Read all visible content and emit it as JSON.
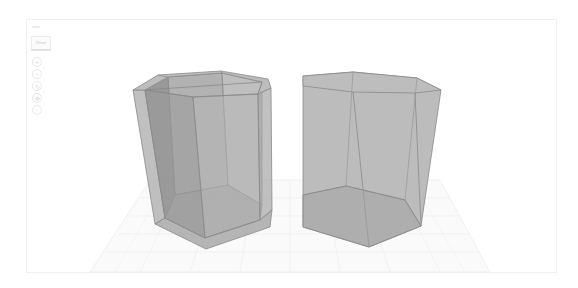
{
  "viewer": {
    "title": "3D View",
    "background": "#ffffff",
    "frame_border": "#f0f0f0"
  },
  "toolbar": {
    "header_label": "view",
    "reset_button_label": "Reset",
    "icons": [
      {
        "name": "zoom-in-icon",
        "glyph": "+"
      },
      {
        "name": "zoom-out-icon",
        "glyph": "−"
      },
      {
        "name": "rotate-icon",
        "glyph": "↻"
      },
      {
        "name": "pan-icon",
        "glyph": "✥"
      },
      {
        "name": "fit-icon",
        "glyph": "◦"
      }
    ]
  },
  "scene": {
    "floor_grid_color": "#e6e6e6",
    "objects": [
      {
        "name": "hollow-hexagonal-prism",
        "fill": "#a9a9a9",
        "edge": "#8a8a8a",
        "hollow": true
      },
      {
        "name": "solid-hexagonal-prism",
        "fill": "#a9a9a9",
        "edge": "#8a8a8a",
        "hollow": false
      }
    ]
  }
}
